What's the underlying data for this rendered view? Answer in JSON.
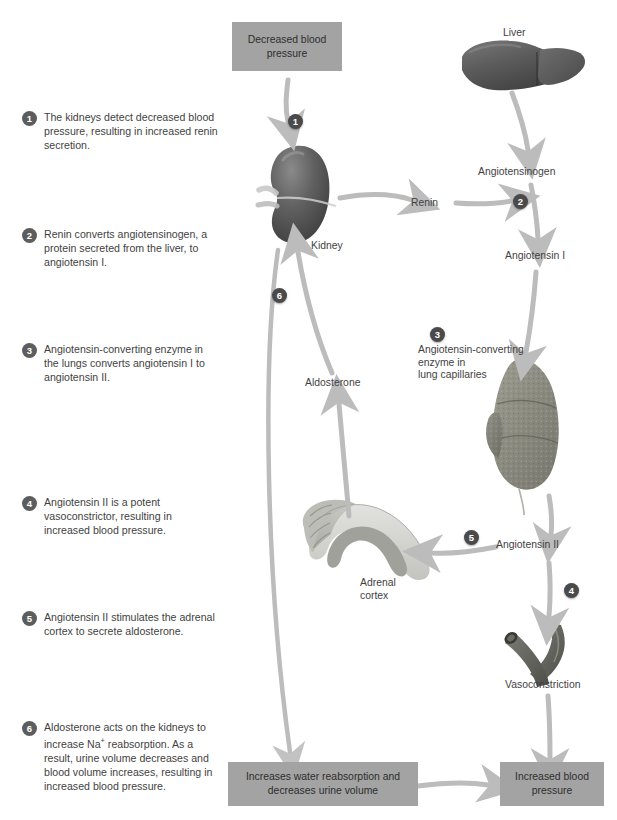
{
  "steps": [
    {
      "n": "1",
      "text": "The kidneys detect decreased blood pressure, resulting in increased renin secretion."
    },
    {
      "n": "2",
      "text": "Renin converts angiotensinogen, a protein secreted from the liver, to angiotensin I."
    },
    {
      "n": "3",
      "text": "Angiotensin-converting enzyme in the lungs converts angiotensin I to angiotensin II."
    },
    {
      "n": "4",
      "text": "Angiotensin II is a potent vasoconstrictor, resulting in increased blood pressure."
    },
    {
      "n": "5",
      "text": "Angiotensin II stimulates the adrenal cortex to secrete aldosterone."
    },
    {
      "n": "6",
      "text": "Aldosterone acts on the kidneys to increase Na+ reabsorption. As a result, urine volume decreases and blood volume increases, resulting in increased blood pressure."
    }
  ],
  "boxes": {
    "decreased_bp": "Decreased\nblood pressure",
    "water_reabsorption": "Increases water reabsorption\nand decreases urine volume",
    "increased_bp": "Increased\nblood pressure"
  },
  "labels": {
    "liver": "Liver",
    "angiotensinogen": "Angiotensinogen",
    "kidney": "Kidney",
    "renin": "Renin",
    "angiotensin_i": "Angiotensin I",
    "ace_lung": "Angiotensin-converting\nenzyme in\nlung capillaries",
    "angiotensin_ii": "Angiotensin II",
    "vasoconstriction": "Vasoconstriction",
    "aldosterone": "Aldosterone",
    "adrenal_cortex": "Adrenal\ncortex"
  },
  "markers": {
    "m1": "1",
    "m2": "2",
    "m3": "3",
    "m4": "4",
    "m5": "5",
    "m6": "6"
  },
  "colors": {
    "box_fill": "#a3a3a3",
    "badge": "#5d5d5d",
    "arrow": "#b9b9b9",
    "organ_dark": "#5a5a5a",
    "lung": "#8e8e84",
    "adrenal_light": "#d8d8d4",
    "adrenal_dark": "#a6a6a0",
    "text": "#3f3f3f"
  },
  "organs": {
    "liver": "liver-illustration",
    "kidney": "kidney-illustration",
    "lung": "lung-illustration",
    "adrenal": "adrenal-gland-illustration",
    "vessel": "blood-vessel-illustration"
  }
}
